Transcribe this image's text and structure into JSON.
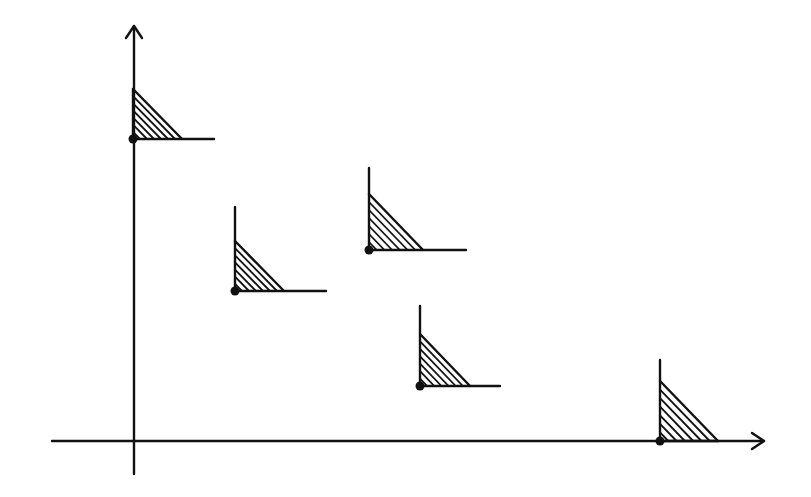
{
  "diagram": {
    "type": "staircase-points-with-hatched-regions",
    "ink_color": "#111111",
    "background": "#ffffff",
    "axes": {
      "x_axis": {
        "from": [
          52,
          441
        ],
        "to": [
          764,
          441
        ],
        "arrow": true
      },
      "y_axis": {
        "from": [
          134,
          474
        ],
        "to": [
          134,
          26
        ],
        "arrow": true
      }
    },
    "markers": [
      {
        "id": 1,
        "point": [
          133,
          139
        ],
        "vline_top": 89,
        "tri_top": 89,
        "tri_right": 182,
        "hline_end": 214
      },
      {
        "id": 2,
        "point": [
          235,
          291
        ],
        "vline_top": 207,
        "tri_top": 241,
        "tri_right": 284,
        "hline_end": 326
      },
      {
        "id": 3,
        "point": [
          369,
          250
        ],
        "vline_top": 168,
        "tri_top": 194,
        "tri_right": 423,
        "hline_end": 466
      },
      {
        "id": 4,
        "point": [
          420,
          386
        ],
        "vline_top": 306,
        "tri_top": 334,
        "tri_right": 470,
        "hline_end": 500
      },
      {
        "id": 5,
        "point": [
          660,
          441
        ],
        "vline_top": 360,
        "tri_top": 381,
        "tri_right": 718,
        "hline_end": 718
      }
    ],
    "hatch_lines_per_region": 6
  }
}
